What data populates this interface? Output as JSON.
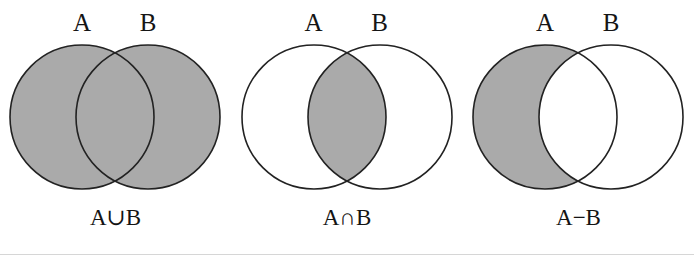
{
  "figure": {
    "width": 694,
    "height": 261,
    "background_color": "#FFFFFF",
    "shade_color": "#AAAAAA",
    "outline_color": "#222222",
    "text_color": "#141414",
    "rule_color": "#D6D6D6",
    "circle_radius": 72,
    "circle_center_y": 117,
    "circle_center_offset": 33
  },
  "panels": [
    {
      "id": "union",
      "caption": "A∪B",
      "operation_name": "union",
      "label_a": "A",
      "label_b": "B",
      "shaded_regions": [
        "A-only",
        "A-and-B",
        "B-only"
      ],
      "a_fill": "#AAAAAA",
      "b_fill": "#AAAAAA",
      "intersection_fill": "#AAAAAA"
    },
    {
      "id": "intersection",
      "caption": "A∩B",
      "operation_name": "intersection",
      "label_a": "A",
      "label_b": "B",
      "shaded_regions": [
        "A-and-B"
      ],
      "a_fill": "#FFFFFF",
      "b_fill": "#FFFFFF",
      "intersection_fill": "#AAAAAA"
    },
    {
      "id": "difference",
      "caption": "A−B",
      "operation_name": "difference",
      "label_a": "A",
      "label_b": "B",
      "shaded_regions": [
        "A-only"
      ],
      "a_fill": "#AAAAAA",
      "b_fill": "#FFFFFF",
      "intersection_fill": "#FFFFFF"
    }
  ]
}
